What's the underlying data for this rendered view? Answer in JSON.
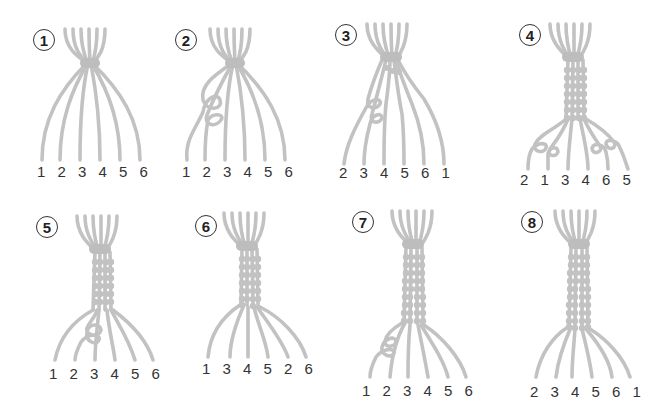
{
  "diagram": {
    "strand_color": "#c2c2c2",
    "label_color": "#333333",
    "panels": [
      {
        "step": "1",
        "labels": [
          "1",
          "2",
          "3",
          "4",
          "5",
          "6"
        ],
        "braid_rows": 0,
        "note": "Strands tied at top, spread apart"
      },
      {
        "step": "2",
        "labels": [
          "1",
          "2",
          "3",
          "4",
          "5",
          "6"
        ],
        "braid_rows": 0,
        "note": "Strand 1 knotted around strand 2"
      },
      {
        "step": "3",
        "labels": [
          "2",
          "3",
          "4",
          "5",
          "6",
          "1"
        ],
        "braid_rows": 1,
        "note": "Strand 1 moved across to the right"
      },
      {
        "step": "4",
        "labels": [
          "2",
          "1",
          "3",
          "4",
          "6",
          "5"
        ],
        "braid_rows": 6,
        "note": "Knots on outer pairs"
      },
      {
        "step": "5",
        "labels": [
          "1",
          "2",
          "3",
          "4",
          "5",
          "6"
        ],
        "braid_rows": 6,
        "note": "Knot on strand 3"
      },
      {
        "step": "6",
        "labels": [
          "1",
          "3",
          "4",
          "5",
          "2",
          "6"
        ],
        "braid_rows": 7,
        "note": "Continue braiding"
      },
      {
        "step": "7",
        "labels": [
          "1",
          "2",
          "3",
          "4",
          "5",
          "6"
        ],
        "braid_rows": 9,
        "note": "Knot with strand 1 around 2"
      },
      {
        "step": "8",
        "labels": [
          "2",
          "3",
          "4",
          "5",
          "6",
          "1"
        ],
        "braid_rows": 10,
        "note": "Finished braid"
      }
    ]
  }
}
